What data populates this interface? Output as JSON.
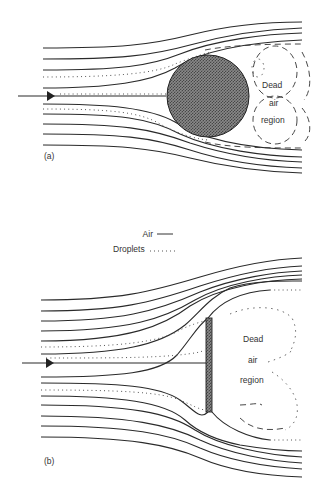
{
  "figure": {
    "panel_a": {
      "label": "(a)",
      "obstacle": "sphere",
      "region_label": [
        "Dead",
        "air",
        "region"
      ]
    },
    "legend": {
      "air_label": "Air",
      "droplets_label": "Droplets"
    },
    "panel_b": {
      "label": "(b)",
      "obstacle": "flat-plate",
      "region_label": [
        "Dead",
        "air",
        "region"
      ]
    },
    "colors": {
      "line": "#2a2a2a",
      "obstacle_fill": "#6a6a6a",
      "background": "#ffffff"
    }
  }
}
